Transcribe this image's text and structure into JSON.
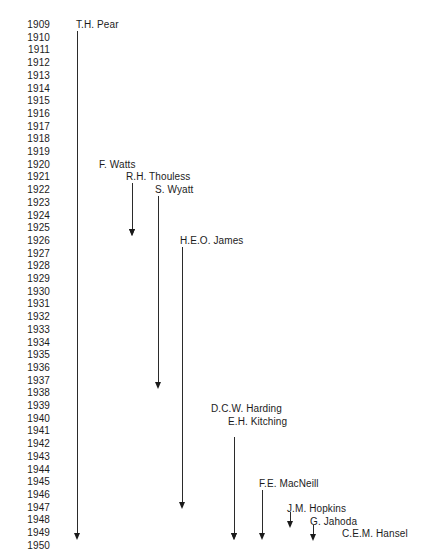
{
  "chart_data": {
    "type": "table",
    "title": "",
    "subtitle": "",
    "xlabel": "",
    "ylabel": "",
    "grid": false,
    "legend": "none",
    "orientation": "vertical-timeline",
    "axis": {
      "name": "Year",
      "start": 1909,
      "end": 1950,
      "tick_step": 1,
      "tick_labels": [
        "1909",
        "1910",
        "1911",
        "1912",
        "1913",
        "1914",
        "1915",
        "1916",
        "1917",
        "1918",
        "1919",
        "1920",
        "1921",
        "1922",
        "1923",
        "1924",
        "1925",
        "1926",
        "1927",
        "1928",
        "1929",
        "1930",
        "1931",
        "1932",
        "1933",
        "1934",
        "1935",
        "1936",
        "1937",
        "1938",
        "1939",
        "1940",
        "1941",
        "1942",
        "1943",
        "1944",
        "1945",
        "1946",
        "1947",
        "1948",
        "1949",
        "1950"
      ]
    },
    "categories": [
      "T.H. Pear",
      "F. Watts",
      "R.H. Thouless",
      "S. Wyatt",
      "H.E.O. James",
      "D.C.W. Harding",
      "E.H. Kitching",
      "F.E. MacNeill",
      "J.M. Hopkins",
      "G. Jahoda",
      "C.E.M. Hansel"
    ],
    "series": [
      {
        "name": "T.H. Pear",
        "start": 1909,
        "end": 1950,
        "label": "T.H. Pear"
      },
      {
        "name": "F. Watts",
        "start": 1920,
        "end": 1926,
        "label": "F. Watts"
      },
      {
        "name": "R.H. Thouless",
        "start": 1921,
        "end": 1938,
        "label": "R.H. Thouless"
      },
      {
        "name": "S. Wyatt",
        "start": 1922,
        "end": 1948,
        "label": "S. Wyatt"
      },
      {
        "name": "H.E.O. James",
        "start": 1926,
        "end": 1950,
        "label": "H.E.O. James"
      },
      {
        "name": "D.C.W. Harding",
        "start": 1940,
        "end": 1950,
        "label": "D.C.W. Harding"
      },
      {
        "name": "E.H. Kitching",
        "start": 1941,
        "end": 1950,
        "label": "E.H. Kitching"
      },
      {
        "name": "F.E. MacNeill",
        "start": 1946,
        "end": 1950,
        "label": "F.E. MacNeill"
      },
      {
        "name": "J.M. Hopkins",
        "start": 1948,
        "end": 1949,
        "label": "J.M. Hopkins"
      },
      {
        "name": "G. Jahoda",
        "start": 1949,
        "end": 1950,
        "label": "G. Jahoda"
      },
      {
        "name": "C.E.M. Hansel",
        "start": 1950,
        "end": 1950,
        "label": "C.E.M. Hansel"
      }
    ],
    "colors": {
      "line": "#2b2b2b",
      "text": "#1c1c1c",
      "background": "#ffffff"
    }
  },
  "layout": {
    "year_rows": [
      {
        "year": "1909",
        "top": 20
      },
      {
        "year": "1910",
        "top": 32.7
      },
      {
        "year": "1911",
        "top": 45.4
      },
      {
        "year": "1912",
        "top": 58.1
      },
      {
        "year": "1913",
        "top": 70.8
      },
      {
        "year": "1914",
        "top": 83.5
      },
      {
        "year": "1915",
        "top": 96.2
      },
      {
        "year": "1916",
        "top": 108.9
      },
      {
        "year": "1917",
        "top": 121.6
      },
      {
        "year": "1918",
        "top": 134.3
      },
      {
        "year": "1919",
        "top": 147.0
      },
      {
        "year": "1920",
        "top": 159.7
      },
      {
        "year": "1921",
        "top": 172.4
      },
      {
        "year": "1922",
        "top": 185.1
      },
      {
        "year": "1923",
        "top": 197.8
      },
      {
        "year": "1924",
        "top": 210.5
      },
      {
        "year": "1925",
        "top": 223.2
      },
      {
        "year": "1926",
        "top": 235.9
      },
      {
        "year": "1927",
        "top": 248.6
      },
      {
        "year": "1928",
        "top": 261.3
      },
      {
        "year": "1929",
        "top": 274.0
      },
      {
        "year": "1930",
        "top": 286.7
      },
      {
        "year": "1931",
        "top": 299.4
      },
      {
        "year": "1932",
        "top": 312.1
      },
      {
        "year": "1933",
        "top": 324.8
      },
      {
        "year": "1934",
        "top": 337.5
      },
      {
        "year": "1935",
        "top": 350.2
      },
      {
        "year": "1936",
        "top": 362.9
      },
      {
        "year": "1937",
        "top": 375.6
      },
      {
        "year": "1938",
        "top": 388.3
      },
      {
        "year": "1939",
        "top": 401.0
      },
      {
        "year": "1940",
        "top": 413.7
      },
      {
        "year": "1941",
        "top": 426.4
      },
      {
        "year": "1942",
        "top": 439.1
      },
      {
        "year": "1943",
        "top": 451.8
      },
      {
        "year": "1944",
        "top": 464.5
      },
      {
        "year": "1945",
        "top": 477.2
      },
      {
        "year": "1946",
        "top": 489.9
      },
      {
        "year": "1947",
        "top": 502.6
      },
      {
        "year": "1948",
        "top": 515.3
      },
      {
        "year": "1949",
        "top": 528.0
      },
      {
        "year": "1950",
        "top": 540.7
      }
    ],
    "entries": [
      {
        "key": "pear",
        "label": "T.H. Pear",
        "label_left": 76,
        "label_top": 20,
        "line_x": 77,
        "line_top": 31,
        "line_bottom": 533
      },
      {
        "key": "watts",
        "label": "F. Watts",
        "label_left": 99,
        "label_top": 159.7,
        "line_x": 132,
        "line_top": 183,
        "line_bottom": 229
      },
      {
        "key": "thouless",
        "label": "R.H. Thouless",
        "label_left": 126,
        "label_top": 172.4,
        "line_x": 132,
        "line_top": 183,
        "line_bottom": 229
      },
      {
        "key": "wyatt",
        "label": "S. Wyatt",
        "label_left": 155,
        "label_top": 185.1,
        "line_x": 158,
        "line_top": 196,
        "line_bottom": 382
      },
      {
        "key": "james",
        "label": "H.E.O. James",
        "label_left": 180,
        "label_top": 235.9,
        "line_x": 182,
        "line_top": 247,
        "line_bottom": 502
      },
      {
        "key": "harding",
        "label": "D.C.W. Harding",
        "label_left": 211,
        "label_top": 404.0,
        "line_x": 234,
        "line_top": 437,
        "line_bottom": 533
      },
      {
        "key": "kitching",
        "label": "E.H. Kitching",
        "label_left": 228,
        "label_top": 416.7,
        "line_x": 234,
        "line_top": 437,
        "line_bottom": 533
      },
      {
        "key": "macneill",
        "label": "F.E. MacNeill",
        "label_left": 259,
        "label_top": 479.0,
        "line_x": 262,
        "line_top": 490,
        "line_bottom": 533
      },
      {
        "key": "hopkins",
        "label": "J.M. Hopkins",
        "label_left": 287,
        "label_top": 504.0,
        "line_x": 290,
        "line_top": 512,
        "line_bottom": 521
      },
      {
        "key": "jahoda",
        "label": "G. Jahoda",
        "label_left": 310,
        "label_top": 516.7,
        "line_x": 313,
        "line_top": 525,
        "line_bottom": 534
      },
      {
        "key": "hansel",
        "label": "C.E.M. Hansel",
        "label_left": 342,
        "label_top": 529.4,
        "line_x": null,
        "line_top": null,
        "line_bottom": null
      }
    ]
  }
}
